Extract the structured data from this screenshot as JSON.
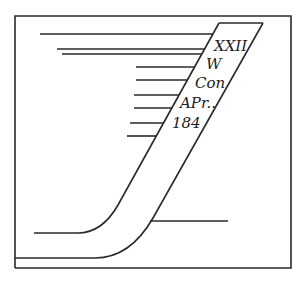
{
  "diagram": {
    "type": "engraved-lettering-band",
    "labels": [
      "XXII",
      "W",
      "Con",
      "APr..",
      "184"
    ],
    "colors": {
      "stroke": "#2a2a2a",
      "background": "#ffffff",
      "text": "#222222"
    }
  }
}
